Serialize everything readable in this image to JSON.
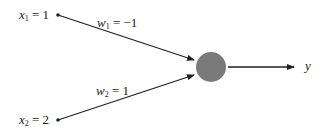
{
  "diagram": {
    "type": "perceptron",
    "inputs": [
      {
        "var": "x",
        "sub": "1",
        "eq": "= 1",
        "value": 1
      },
      {
        "var": "x",
        "sub": "2",
        "eq": "= 2",
        "value": 2
      }
    ],
    "weights": [
      {
        "var": "w",
        "sub": "1",
        "eq": "= −1",
        "value": -1
      },
      {
        "var": "w",
        "sub": "2",
        "eq": "= 1",
        "value": 1
      }
    ],
    "neuron": {
      "fill": "#7a7a7a"
    },
    "output": {
      "var": "y"
    },
    "colors": {
      "line": "#222222",
      "neuron": "#7a7a7a",
      "background": "#ffffff"
    }
  }
}
